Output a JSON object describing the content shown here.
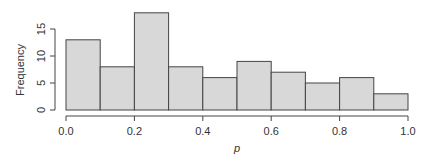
{
  "chart_data": {
    "type": "bar",
    "subtype": "histogram",
    "title": "",
    "xlabel": "p",
    "ylabel": "Frequency",
    "bin_edges": [
      0.0,
      0.1,
      0.2,
      0.3,
      0.4,
      0.5,
      0.6,
      0.7,
      0.8,
      0.9,
      1.0
    ],
    "categories": [
      "0.0-0.1",
      "0.1-0.2",
      "0.2-0.3",
      "0.3-0.4",
      "0.4-0.5",
      "0.5-0.6",
      "0.6-0.7",
      "0.7-0.8",
      "0.8-0.9",
      "0.9-1.0"
    ],
    "values": [
      13,
      8,
      18,
      8,
      6,
      9,
      7,
      5,
      6,
      3
    ],
    "xlim": [
      0.0,
      1.0
    ],
    "ylim": [
      0,
      18
    ],
    "x_ticks": [
      "0.0",
      "0.2",
      "0.4",
      "0.6",
      "0.8",
      "1.0"
    ],
    "y_ticks": [
      "0",
      "5",
      "10",
      "15"
    ],
    "grid": false,
    "legend": null,
    "colors": {
      "bar_fill": "#d8d8d8",
      "bar_stroke": "#444444"
    }
  }
}
